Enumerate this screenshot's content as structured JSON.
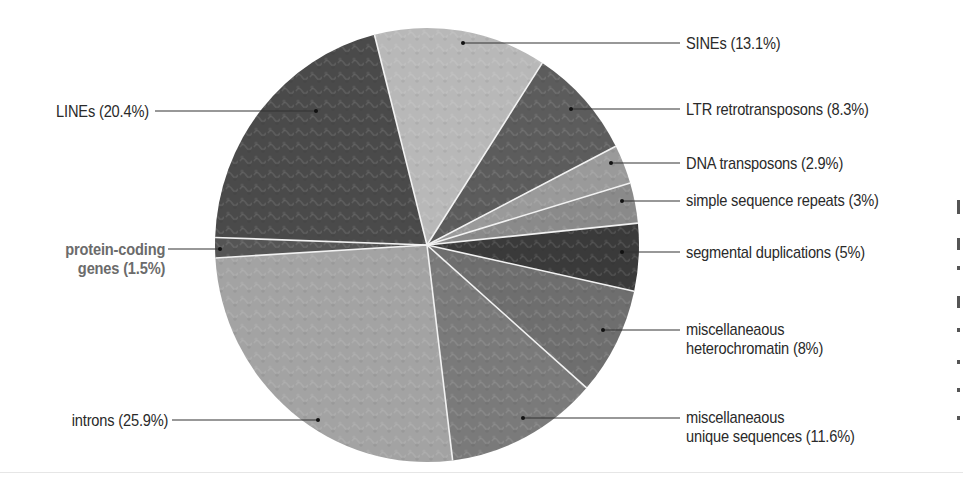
{
  "chart_data": {
    "type": "pie",
    "title": "",
    "units": "%",
    "slices": [
      {
        "label": "SINEs",
        "value": 13.1,
        "display": "SINEs (13.1%)",
        "color": "#b8b8b8"
      },
      {
        "label": "LTR retrotransposons",
        "value": 8.3,
        "display": "LTR retrotransposons (8.3%)",
        "color": "#5c5c5c"
      },
      {
        "label": "DNA transposons",
        "value": 2.9,
        "display": "DNA transposons (2.9%)",
        "color": "#9a9a9a"
      },
      {
        "label": "simple sequence repeats",
        "value": 3,
        "display": "simple sequence repeats (3%)",
        "color": "#8a8a8a"
      },
      {
        "label": "segmental duplications",
        "value": 5,
        "display": "segmental duplications (5%)",
        "color": "#3a3a3a"
      },
      {
        "label": "miscellaneaous heterochromatin",
        "value": 8,
        "display_lines": [
          "miscellaneaous",
          "heterochromatin (8%)"
        ],
        "color": "#6e6e6e"
      },
      {
        "label": "miscellaneaous unique sequences",
        "value": 11.6,
        "display_lines": [
          "miscellaneaous",
          "unique sequences (11.6%)"
        ],
        "color": "#7a7a7a"
      },
      {
        "label": "introns",
        "value": 25.9,
        "display": "introns (25.9%)",
        "color": "#a3a3a3"
      },
      {
        "label": "protein-coding genes",
        "value": 1.5,
        "display_lines": [
          "protein-coding",
          "genes (1.5%)"
        ],
        "color": "#555555",
        "highlight": true
      },
      {
        "label": "LINEs",
        "value": 20.4,
        "display": "LINEs (20.4%)",
        "color": "#4a4a4a"
      }
    ],
    "legend_position": "callout labels with leader lines",
    "grid": false
  },
  "labels": {
    "sines": "SINEs (13.1%)",
    "ltr": "LTR retrotransposons (8.3%)",
    "dna": "DNA transposons (2.9%)",
    "ssr": "simple sequence repeats (3%)",
    "segdup": "segmental duplications (5%)",
    "hetero_1": "miscellaneaous",
    "hetero_2": "heterochromatin (8%)",
    "unique_1": "miscellaneaous",
    "unique_2": "unique sequences (11.6%)",
    "introns": "introns (25.9%)",
    "protein_1": "protein-coding",
    "protein_2": "genes (1.5%)",
    "lines": "LINEs (20.4%)"
  }
}
